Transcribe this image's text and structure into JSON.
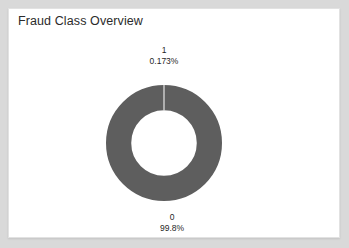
{
  "card": {
    "title": "Fraud Class Overview",
    "background": "#ffffff",
    "frame_color": "#d9d9d9",
    "border_color": "#e2e2e2"
  },
  "chart_data": {
    "type": "pie",
    "variant": "donut",
    "title": "Fraud Class Overview",
    "categories": [
      "0",
      "1"
    ],
    "values": [
      99.8,
      0.173
    ],
    "value_unit": "%",
    "labels": [
      {
        "name": "0",
        "percent": "99.8%",
        "value": 99.8,
        "position": "bottom"
      },
      {
        "name": "1",
        "percent": "0.173%",
        "value": 0.173,
        "position": "top"
      }
    ],
    "colors": {
      "slice_0": "#5e5e5e",
      "slice_1": "#5e5e5e",
      "separator": "#f2f2f2"
    },
    "legend": "none",
    "grid": false,
    "start_angle_deg": 90,
    "direction": "clockwise",
    "hole_ratio": 0.565,
    "outer_diameter_px": 116,
    "center": {
      "x": 155,
      "y": 134
    }
  }
}
